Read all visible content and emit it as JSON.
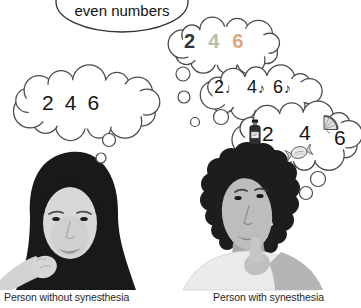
{
  "figure": {
    "prompt_bubble": {
      "text": "even numbers"
    },
    "left_person": {
      "caption": "Person without synesthesia",
      "plain_thought": {
        "numbers": [
          "2",
          "4",
          "6"
        ]
      }
    },
    "right_person": {
      "caption": "Person with synesthesia",
      "color_thought": {
        "items": [
          {
            "number": "2",
            "color": "#35353d"
          },
          {
            "number": "4",
            "color": "#b2c1a9"
          },
          {
            "number": "6",
            "color": "#dfa57b"
          }
        ]
      },
      "sound_thought": {
        "items": [
          {
            "number": "2",
            "note": "♩"
          },
          {
            "number": "4",
            "note": "♪"
          },
          {
            "number": "6",
            "note": "♪"
          }
        ]
      },
      "taste_thought": {
        "items": [
          {
            "number": "2",
            "object": "sauce-bottle"
          },
          {
            "number": "4",
            "object": "wrapped-candy"
          },
          {
            "number": "6",
            "object": "fruit-slice"
          }
        ]
      }
    },
    "ink_color": "#4a4a4a"
  }
}
